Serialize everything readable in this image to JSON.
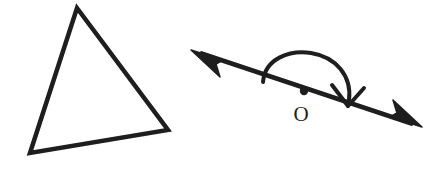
{
  "figure": {
    "background_color": "#ffffff",
    "stroke_color": "#1e1e1e",
    "width": 432,
    "height": 187
  },
  "triangle": {
    "name": "scalene-triangle",
    "stroke_width": 4.5,
    "fill": "none",
    "vertices": [
      {
        "label": "",
        "x": 77,
        "y": 8
      },
      {
        "label": "",
        "x": 168,
        "y": 130
      },
      {
        "label": "",
        "x": 30,
        "y": 153
      }
    ],
    "path": "M 77 8 L 168 130 L 30 153 Z"
  },
  "rotation_figure": {
    "name": "rotation-about-point-o",
    "axis_line": {
      "name": "double-headed-arrow-line",
      "stroke_width": 4.5,
      "start_x": 200,
      "start_y": 53,
      "end_x": 413,
      "end_y": 124,
      "left_arrowhead": {
        "tip_x": 191,
        "tip_y": 50,
        "points": "191,50 223,60 216,64 220,77"
      },
      "right_arrowhead": {
        "tip_x": 422,
        "tip_y": 127,
        "points": "422,127 390,117 397,113 393,100"
      }
    },
    "center_point": {
      "name": "point-o-dot",
      "x": 304,
      "y": 91,
      "radius": 4.2
    },
    "center_label": {
      "name": "point-o-label",
      "text": "O",
      "x": 301,
      "y": 121
    },
    "rotation_arc": {
      "name": "rotation-arc-180",
      "stroke_width": 4,
      "angle_degrees": 180,
      "direction": "clockwise",
      "path": "M 263 82 C 265 58, 290 50, 311 53 C 336 57, 352 76, 349 100",
      "arrowhead": {
        "name": "arc-arrowhead",
        "style": "open-v",
        "tip_x": 348,
        "tip_y": 106,
        "left_barb": "332,85 348,106",
        "right_barb": "364,88 348,106"
      }
    }
  }
}
